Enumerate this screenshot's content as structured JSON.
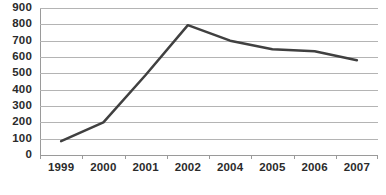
{
  "chart_data": {
    "type": "line",
    "title": "",
    "subtitle": "",
    "xlabel": "",
    "ylabel": "",
    "categories": [
      "1999",
      "2000",
      "2001",
      "2002",
      "2004",
      "2005",
      "2006",
      "2007"
    ],
    "values": [
      85,
      200,
      490,
      795,
      700,
      648,
      635,
      580
    ],
    "series": [
      {
        "name": "",
        "values": [
          85,
          200,
          490,
          795,
          700,
          648,
          635,
          580
        ]
      }
    ],
    "ylim": [
      0,
      900
    ],
    "ytick_step": 100,
    "yticks": [
      900,
      800,
      700,
      600,
      500,
      400,
      300,
      200,
      100,
      0
    ],
    "xticks": [
      "1999",
      "2000",
      "2001",
      "2002",
      "2004",
      "2005",
      "2006",
      "2007"
    ],
    "grid": true,
    "grid_axis": "y",
    "legend": false,
    "legend_position": "none",
    "markers": false,
    "annotations": [],
    "colors": {
      "line": "#404040",
      "gridline": "#b4b4b4",
      "axis": "#9a9a9a",
      "tick_label": "#2b2b2b",
      "background": "#ffffff"
    },
    "line_width": 2.5
  }
}
